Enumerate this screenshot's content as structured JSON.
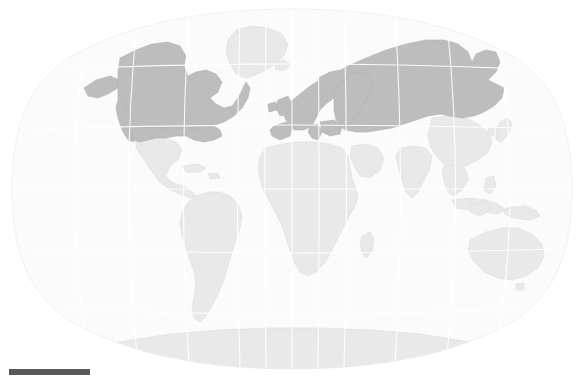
{
  "figure": {
    "type": "world-map",
    "projection": "winkel-tripel",
    "title": "",
    "background_color": "#ffffff",
    "width": 584,
    "height": 378
  },
  "map": {
    "ocean_color": "#fbfbfb",
    "globe_outline_color": "#f2f2f2",
    "graticule_color": "#ffffff",
    "graticule_visible": true,
    "land_default_color": "#e9e9e9",
    "land_border_color": "#dddddd",
    "highlight_color": "#bdbdbd",
    "highlight_border_color": "#b2b2b2",
    "center_longitude": 0,
    "longitude_range": [
      -180,
      180
    ],
    "latitude_range": [
      -90,
      90
    ],
    "graticule_spacing_degrees": 30
  },
  "regions": {
    "highlighted": [
      {
        "name": "Canada",
        "color": "#bdbdbd"
      },
      {
        "name": "United States of America",
        "color": "#bdbdbd"
      },
      {
        "name": "Europe",
        "color": "#bdbdbd"
      },
      {
        "name": "Russia",
        "color": "#bdbdbd"
      }
    ],
    "unhighlighted": [
      {
        "name": "Greenland",
        "color": "#e9e9e9"
      },
      {
        "name": "Mexico",
        "color": "#e9e9e9"
      },
      {
        "name": "Central America",
        "color": "#e9e9e9"
      },
      {
        "name": "South America",
        "color": "#e9e9e9"
      },
      {
        "name": "Africa",
        "color": "#e9e9e9"
      },
      {
        "name": "Middle East",
        "color": "#e9e9e9"
      },
      {
        "name": "South Asia",
        "color": "#e9e9e9"
      },
      {
        "name": "China",
        "color": "#e9e9e9"
      },
      {
        "name": "Southeast Asia",
        "color": "#e9e9e9"
      },
      {
        "name": "Japan",
        "color": "#e9e9e9"
      },
      {
        "name": "Australia",
        "color": "#e9e9e9"
      },
      {
        "name": "New Zealand",
        "color": "#e9e9e9"
      },
      {
        "name": "Antarctica",
        "color": "#e9e9e9"
      }
    ]
  },
  "legend": {
    "scale_bar": {
      "visible": true,
      "color": "#585858",
      "label": "",
      "x": 9,
      "y": 369,
      "width": 81,
      "height": 6
    }
  }
}
